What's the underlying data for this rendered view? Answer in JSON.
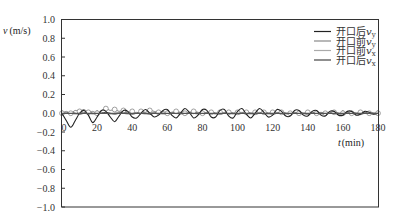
{
  "chart_data": {
    "type": "line",
    "title": "",
    "xlabel": "t (min)",
    "ylabel": "v (m/s)",
    "xlim": [
      0,
      180
    ],
    "ylim": [
      -1.0,
      1.0
    ],
    "x_ticks": [
      "0",
      "20",
      "40",
      "60",
      "80",
      "100",
      "120",
      "140",
      "160",
      "180"
    ],
    "y_ticks": [
      "1.0",
      "0.8",
      "0.6",
      "0.4",
      "0.2",
      "0.0",
      "-0.2",
      "-0.4",
      "-0.6",
      "-0.8",
      "-1.0"
    ],
    "grid": false,
    "legend_position": "upper right",
    "x": [
      0,
      2.5,
      5,
      7.5,
      10,
      12.5,
      15,
      17.5,
      20,
      22.5,
      25,
      27.5,
      30,
      32.5,
      35,
      37.5,
      40,
      42.5,
      45,
      47.5,
      50,
      52.5,
      55,
      57.5,
      60,
      62.5,
      65,
      67.5,
      70,
      72.5,
      75,
      77.5,
      80,
      82.5,
      85,
      87.5,
      90,
      92.5,
      95,
      97.5,
      100,
      102.5,
      105,
      107.5,
      110,
      112.5,
      115,
      117.5,
      120,
      122.5,
      125,
      127.5,
      130,
      132.5,
      135,
      137.5,
      140,
      142.5,
      145,
      147.5,
      150,
      152.5,
      155,
      157.5,
      160,
      162.5,
      165,
      167.5,
      170,
      172.5,
      175,
      177.5,
      180
    ],
    "series": [
      {
        "name": "开口后v_y",
        "color": "#222222",
        "marker": "none",
        "values": [
          0.0,
          -0.08,
          -0.15,
          -0.08,
          0.0,
          0.03,
          -0.02,
          -0.1,
          -0.04,
          0.03,
          0.02,
          -0.04,
          -0.09,
          -0.03,
          0.03,
          0.02,
          -0.04,
          -0.05,
          0.0,
          0.04,
          0.0,
          -0.04,
          -0.02,
          0.03,
          0.04,
          -0.02,
          -0.05,
          0.0,
          0.05,
          0.01,
          -0.05,
          -0.02,
          0.04,
          0.03,
          -0.04,
          -0.04,
          0.03,
          0.04,
          -0.03,
          -0.05,
          0.02,
          0.05,
          -0.01,
          -0.05,
          0.0,
          0.05,
          0.01,
          -0.04,
          -0.02,
          0.04,
          0.02,
          -0.03,
          -0.03,
          0.03,
          0.03,
          -0.02,
          -0.03,
          0.02,
          0.03,
          -0.02,
          -0.03,
          0.02,
          0.02,
          -0.02,
          -0.02,
          0.02,
          0.02,
          -0.02,
          -0.01,
          0.02,
          0.01,
          -0.01,
          0.0
        ]
      },
      {
        "name": "开口前v_y",
        "color": "#888888",
        "marker": "circle",
        "values": [
          0.0,
          0.02,
          0.0,
          0.03,
          0.02,
          0.04,
          0.01,
          0.02,
          0.0,
          0.03,
          0.05,
          0.03,
          0.04,
          0.02,
          0.03,
          0.01,
          0.02,
          0.0,
          0.02,
          0.01,
          0.03,
          0.02,
          0.01,
          0.02,
          0.0,
          0.01,
          0.02,
          0.01,
          0.0,
          0.01,
          0.02,
          0.01,
          0.0,
          0.01,
          0.01,
          0.0,
          0.01,
          0.0,
          0.01,
          0.0,
          0.01,
          0.0,
          0.01,
          0.0,
          0.01,
          0.0,
          0.01,
          0.0,
          0.01,
          0.0,
          0.01,
          0.0,
          0.0,
          0.01,
          0.0,
          0.0,
          0.01,
          0.0,
          0.0,
          0.01,
          0.0,
          0.0,
          0.01,
          0.0,
          0.0,
          0.01,
          0.0,
          0.0,
          0.01,
          0.0,
          0.0,
          0.0,
          0.0
        ]
      },
      {
        "name": "开口前v_x",
        "color": "#aaaaaa",
        "marker": "none",
        "values": [
          0.0,
          0.01,
          0.0,
          -0.01,
          0.0,
          0.01,
          0.0,
          -0.01,
          0.0,
          0.01,
          0.0,
          -0.01,
          0.0,
          0.01,
          0.0,
          -0.01,
          0.0,
          0.01,
          0.0,
          -0.01,
          0.0,
          0.01,
          0.0,
          -0.01,
          0.0,
          0.01,
          0.0,
          -0.01,
          0.0,
          0.01,
          0.0,
          -0.01,
          0.0,
          0.01,
          0.0,
          -0.01,
          0.0,
          0.01,
          0.0,
          -0.01,
          0.0,
          0.01,
          0.0,
          -0.01,
          0.0,
          0.01,
          0.0,
          -0.01,
          0.0,
          0.01,
          0.0,
          -0.01,
          0.0,
          0.01,
          0.0,
          -0.01,
          0.0,
          0.01,
          0.0,
          -0.01,
          0.0,
          0.01,
          0.0,
          -0.01,
          0.0,
          0.01,
          0.0,
          -0.01,
          0.0,
          0.01,
          0.0,
          -0.01,
          0.0
        ]
      },
      {
        "name": "开口后v_x",
        "color": "#444444",
        "marker": "none",
        "values": [
          0.0,
          0.0,
          0.01,
          0.0,
          -0.01,
          0.0,
          0.01,
          0.0,
          -0.01,
          0.0,
          0.01,
          0.0,
          -0.01,
          0.0,
          0.01,
          0.0,
          -0.01,
          0.0,
          0.01,
          0.0,
          -0.01,
          0.0,
          0.01,
          0.0,
          -0.01,
          0.0,
          0.01,
          0.0,
          -0.01,
          0.0,
          0.01,
          0.0,
          -0.01,
          0.0,
          0.01,
          0.0,
          -0.01,
          0.0,
          0.01,
          0.0,
          -0.01,
          0.0,
          0.01,
          0.0,
          -0.01,
          0.0,
          0.01,
          0.0,
          -0.01,
          0.0,
          0.01,
          0.0,
          -0.01,
          0.0,
          0.01,
          0.0,
          -0.01,
          0.0,
          0.01,
          0.0,
          -0.01,
          0.0,
          0.01,
          0.0,
          -0.01,
          0.0,
          0.01,
          0.0,
          -0.01,
          0.0,
          0.01,
          0.0,
          0.0
        ]
      }
    ]
  },
  "axes": {
    "y_title_var": "v",
    "y_title_unit": "(m/s)",
    "x_title_var": "t",
    "x_title_unit": "(min)"
  },
  "legend": [
    {
      "base": "开口后",
      "var": "v",
      "sub": "y",
      "color": "#222222"
    },
    {
      "base": "开口前",
      "var": "v",
      "sub": "y",
      "color": "#888888"
    },
    {
      "base": "开口前",
      "var": "v",
      "sub": "x",
      "color": "#aaaaaa"
    },
    {
      "base": "开口后",
      "var": "v",
      "sub": "x",
      "color": "#444444"
    }
  ]
}
